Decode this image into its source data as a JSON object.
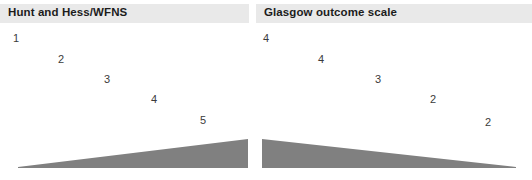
{
  "figure": {
    "background_color": "#ffffff",
    "wedge_color": "#808080",
    "header_band_color": "#e9e9e9",
    "header_text_color": "#1c1c1c",
    "label_text_color": "#3b3b3b"
  },
  "panels": [
    {
      "id": "hunt-hess-wfns",
      "title": "Hunt and Hess/WFNS",
      "labels": [
        {
          "text": "1",
          "x": 13,
          "y": 33
        },
        {
          "text": "2",
          "x": 58,
          "y": 54
        },
        {
          "text": "3",
          "x": 104,
          "y": 74
        },
        {
          "text": "4",
          "x": 151,
          "y": 94
        },
        {
          "text": "5",
          "x": 200,
          "y": 115
        }
      ],
      "wedge": {
        "direction": "increasing-right",
        "left": 18,
        "top": 137,
        "width": 230,
        "height": 31,
        "thin_end_px": 1,
        "thick_end_px": 29
      }
    },
    {
      "id": "glasgow-outcome-scale",
      "title": "Glasgow outcome scale",
      "labels": [
        {
          "text": "4",
          "x": 7,
          "y": 33
        },
        {
          "text": "4",
          "x": 62,
          "y": 54
        },
        {
          "text": "3",
          "x": 119,
          "y": 74
        },
        {
          "text": "2",
          "x": 174,
          "y": 94
        },
        {
          "text": "2",
          "x": 229,
          "y": 117
        }
      ],
      "wedge": {
        "direction": "decreasing-right",
        "left": 6,
        "top": 137,
        "width": 254,
        "height": 31,
        "thin_end_px": 1,
        "thick_end_px": 29
      }
    }
  ]
}
